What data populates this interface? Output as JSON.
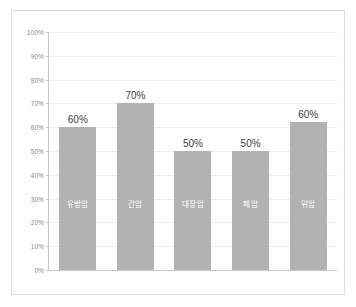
{
  "chart_data": {
    "type": "bar",
    "title": "",
    "subtitle": "",
    "xlabel": "",
    "ylabel": "",
    "categories": [
      "유방암",
      "간암",
      "대장암",
      "폐암",
      "위암"
    ],
    "values": [
      60,
      70,
      50,
      50,
      60
    ],
    "value_labels": [
      "60%",
      "70%",
      "50%",
      "50%",
      "60%"
    ],
    "bar_draw_percent": [
      60,
      70,
      50,
      50,
      62
    ],
    "ylim": [
      0,
      100
    ],
    "ytick_values": [
      100,
      90,
      80,
      70,
      60,
      50,
      40,
      30,
      20,
      10,
      0
    ],
    "ytick_labels": [
      "100%",
      "90%",
      "80%",
      "70%",
      "60%",
      "50%",
      "40%",
      "30%",
      "20%",
      "10%",
      "0%"
    ],
    "grid": true,
    "grid_axis": "y",
    "legend": false,
    "legend_position": "none",
    "series": [
      {
        "name": "",
        "values": [
          60,
          70,
          50,
          50,
          60
        ]
      }
    ],
    "colors": {
      "bar_fill": "#b2b2b2",
      "gridline": "#ededed",
      "axis_line": "#c8c8c8",
      "tick_label": "#8a8a8a",
      "value_label": "#404040",
      "category_label": "#ffffff",
      "frame_border": "#dcdcdc",
      "background": "#ffffff"
    }
  }
}
